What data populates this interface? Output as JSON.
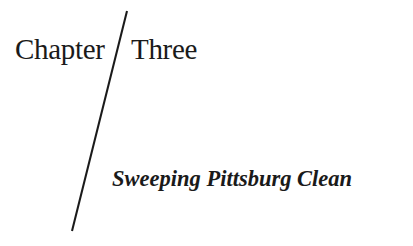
{
  "chapter": {
    "label_part1": "Chapter",
    "label_part2": "Three",
    "subtitle": "Sweeping Pittsburg Clean"
  },
  "colors": {
    "text": "#1a1a1a",
    "background": "#ffffff",
    "rule": "#1a1a1a"
  }
}
